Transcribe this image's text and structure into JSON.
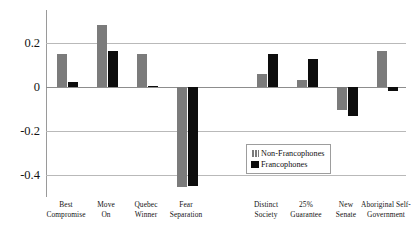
{
  "chart_data": {
    "type": "bar",
    "title": "",
    "subtitle": "",
    "xlabel": "",
    "ylabel": "",
    "ylim": [
      -0.5,
      0.32
    ],
    "yticks": [
      0.2,
      0,
      -0.2,
      -0.4
    ],
    "ytick_labels": [
      "0.2",
      "0",
      "-0.2",
      "-0.4"
    ],
    "grid": true,
    "legend_position": "inside-right-lower",
    "categories": [
      "Best Compromise",
      "Move On",
      "Quebec Winner",
      "Fear Separation",
      "",
      "Distinct Society",
      "25% Guarantee",
      "New Senate",
      "Aboriginal Self-Government"
    ],
    "series": [
      {
        "name": "Non-Francophones",
        "color": "#7b7b7b",
        "values": [
          0.15,
          0.285,
          0.15,
          -0.455,
          null,
          0.06,
          0.033,
          -0.105,
          0.163
        ]
      },
      {
        "name": "Francophones",
        "color": "#0d0d0d",
        "values": [
          0.025,
          0.165,
          0.005,
          -0.45,
          null,
          0.152,
          0.13,
          -0.133,
          -0.018
        ]
      }
    ]
  },
  "axis": {
    "ticks": [
      {
        "label": "0.2",
        "value": 0.2
      },
      {
        "label": "0",
        "value": 0
      },
      {
        "label": "-0.2",
        "value": -0.2
      },
      {
        "label": "-0.4",
        "value": -0.4
      }
    ]
  },
  "categories": [
    {
      "line1": "Best",
      "line2": "Compromise"
    },
    {
      "line1": "Move",
      "line2": "On"
    },
    {
      "line1": "Quebec",
      "line2": "Winner"
    },
    {
      "line1": "Fear",
      "line2": "Separation"
    },
    {
      "line1": "",
      "line2": ""
    },
    {
      "line1": "Distinct",
      "line2": "Society"
    },
    {
      "line1": "25%",
      "line2": "Guarantee"
    },
    {
      "line1": "New",
      "line2": "Senate"
    },
    {
      "line1": "Aboriginal Self-",
      "line2": "Government"
    }
  ],
  "legend": {
    "items": [
      {
        "label": "Non-Francophones",
        "color": "#7b7b7b"
      },
      {
        "label": "Francophones",
        "color": "#0d0d0d"
      }
    ]
  }
}
